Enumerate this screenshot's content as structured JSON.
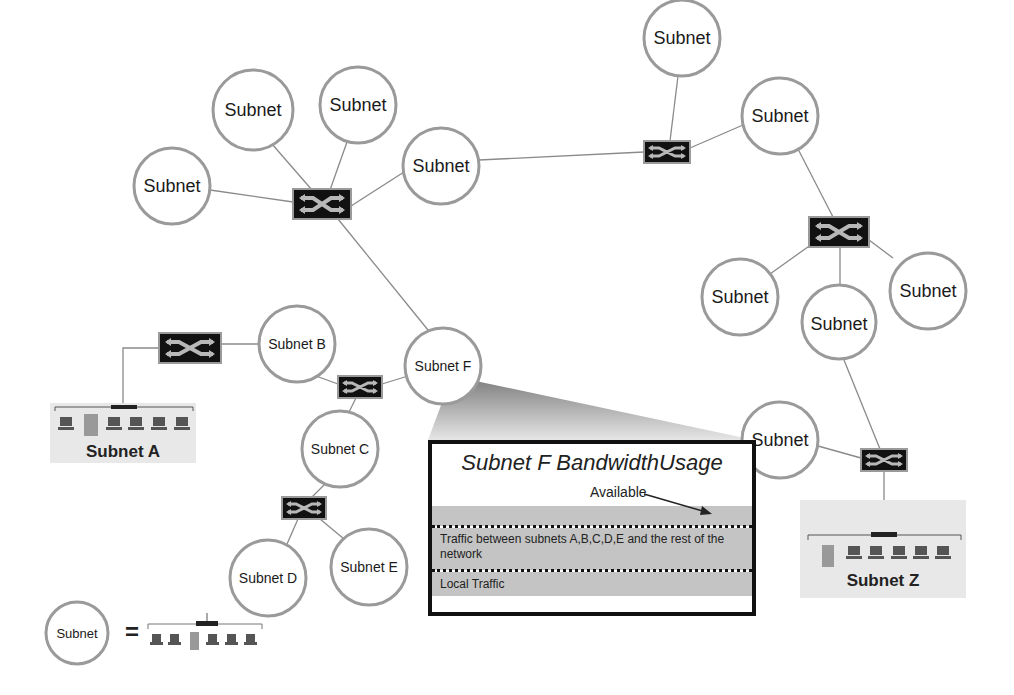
{
  "diagram": {
    "subnet_generic_label": "Subnet",
    "nodes": {
      "subnet_b": "Subnet B",
      "subnet_c": "Subnet C",
      "subnet_d": "Subnet D",
      "subnet_e": "Subnet E",
      "subnet_f": "Subnet F",
      "subnet_a": "Subnet A",
      "subnet_z": "Subnet Z"
    },
    "callout": {
      "title": "Subnet F BandwidthUsage",
      "available": "Available",
      "traffic_between": "Traffic between subnets A,B,C,D,E and the rest of the network",
      "local_traffic": "Local Traffic"
    },
    "legend": {
      "circle_label": "Subnet",
      "equals": "="
    },
    "partial_label": "Subnet"
  },
  "colors": {
    "circle_stroke": "#9a9a9a",
    "switch_fill": "#111111",
    "switch_arrow": "#b8b8b8",
    "link": "#8a8a8a",
    "band": "#c4c4c4",
    "subnet_box_bg": "#e8e8e8"
  }
}
